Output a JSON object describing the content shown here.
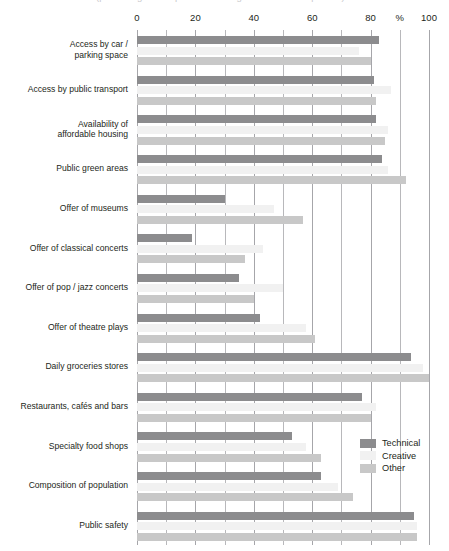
{
  "title": "(percentage of respondents rating the factor as important)",
  "legend": {
    "position": "bottom-right",
    "entries": [
      {
        "name": "Technical",
        "color": "#8c8c8e",
        "swatch": "technical-swatch"
      },
      {
        "name": "Creative",
        "color": "#f1f1f1",
        "swatch": "creative-swatch"
      },
      {
        "name": "Other",
        "color": "#c8c8c8",
        "swatch": "other-swatch"
      }
    ]
  },
  "axis": {
    "unit_label": "%",
    "unit_label_value": 90,
    "ticks": [
      0,
      20,
      40,
      60,
      80,
      100
    ],
    "tick_labels": [
      "0",
      "20",
      "40",
      "60",
      "80",
      "100"
    ],
    "gridline_step": 10,
    "range": [
      0,
      100
    ]
  },
  "chart_data": {
    "type": "bar",
    "orientation": "horizontal",
    "title": "(percentage of respondents rating the factor as important)",
    "xlabel": "%",
    "ylabel": "",
    "xlim": [
      0,
      100
    ],
    "grid": true,
    "legend_position": "bottom-right",
    "categories": [
      "Access by car /\nparking space",
      "Access by public transport",
      "Availability of\naffordable housing",
      "Public green areas",
      "Offer of museums",
      "Offer of classical concerts",
      "Offer of pop / jazz concerts",
      "Offer of theatre plays",
      "Daily groceries stores",
      "Restaurants, cafés and bars",
      "Specialty food shops",
      "Composition of population",
      "Public safety"
    ],
    "series": [
      {
        "name": "Technical",
        "color": "#8c8c8e",
        "values": [
          83,
          81,
          82,
          84,
          30,
          19,
          35,
          42,
          94,
          77,
          53,
          63,
          95
        ]
      },
      {
        "name": "Creative",
        "color": "#f1f1f1",
        "values": [
          76,
          87,
          86,
          86,
          47,
          43,
          50,
          58,
          98,
          82,
          58,
          69,
          96
        ]
      },
      {
        "name": "Other",
        "color": "#c8c8c8",
        "values": [
          80,
          82,
          85,
          92,
          57,
          37,
          40,
          61,
          100,
          80,
          63,
          74,
          96
        ]
      }
    ]
  }
}
